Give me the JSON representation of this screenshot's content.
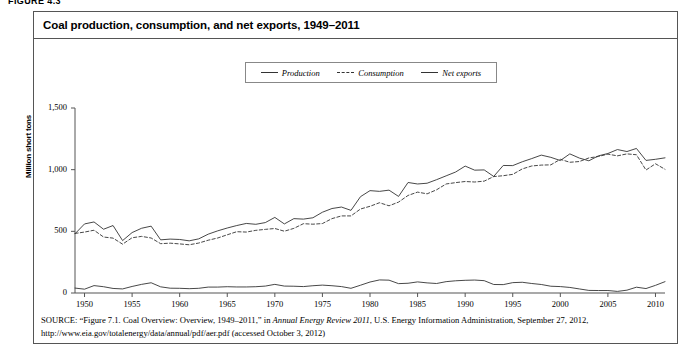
{
  "figure_label": "FIGURE 4.3",
  "title": "Coal production, consumption, and net exports, 1949–2011",
  "legend": {
    "items": [
      {
        "label": "Production",
        "style": "solid"
      },
      {
        "label": "Consumption",
        "style": "dashed"
      },
      {
        "label": "Net exports",
        "style": "solid"
      }
    ]
  },
  "source": {
    "label": "SOURCE:",
    "part1": " “Figure 7.1. Coal Overview: Overview, 1949–2011,” in ",
    "italic1": "Annual Energy Review 2011",
    "part2": ", U.S. Energy Information Administration, September 27, 2012, http://www.eia.gov/totalenergy/data/annual/pdf/aer.pdf (accessed October 3, 2012)"
  },
  "chart_data": {
    "type": "line",
    "title": "Coal production, consumption, and net exports, 1949–2011",
    "xlabel": "",
    "ylabel": "Million short tons",
    "ylim": [
      0,
      1500
    ],
    "xlim": [
      1949,
      2011
    ],
    "yticks": [
      "0",
      "500",
      "1,000",
      "1,500"
    ],
    "ytick_values": [
      0,
      500,
      1000,
      1500
    ],
    "xticks": [
      "1950",
      "1955",
      "1960",
      "1965",
      "1970",
      "1975",
      "1980",
      "1985",
      "1990",
      "1995",
      "2000",
      "2005",
      "2010"
    ],
    "xtick_values": [
      1950,
      1955,
      1960,
      1965,
      1970,
      1975,
      1980,
      1985,
      1990,
      1995,
      2000,
      2005,
      2010
    ],
    "grid": false,
    "legend_position": "top-center",
    "x": [
      1949,
      1950,
      1951,
      1952,
      1953,
      1954,
      1955,
      1956,
      1957,
      1958,
      1959,
      1960,
      1961,
      1962,
      1963,
      1964,
      1965,
      1966,
      1967,
      1968,
      1969,
      1970,
      1971,
      1972,
      1973,
      1974,
      1975,
      1976,
      1977,
      1978,
      1979,
      1980,
      1981,
      1982,
      1983,
      1984,
      1985,
      1986,
      1987,
      1988,
      1989,
      1990,
      1991,
      1992,
      1993,
      1994,
      1995,
      1996,
      1997,
      1998,
      1999,
      2000,
      2001,
      2002,
      2003,
      2004,
      2005,
      2006,
      2007,
      2008,
      2009,
      2010,
      2011
    ],
    "series": [
      {
        "name": "Production",
        "style": "solid",
        "values": [
          480,
          560,
          576,
          517,
          547,
          425,
          490,
          525,
          542,
          431,
          437,
          434,
          423,
          439,
          477,
          504,
          527,
          547,
          564,
          557,
          571,
          613,
          560,
          603,
          599,
          610,
          655,
          685,
          697,
          670,
          781,
          830,
          824,
          834,
          783,
          896,
          884,
          890,
          919,
          950,
          981,
          1029,
          996,
          998,
          945,
          1034,
          1033,
          1064,
          1090,
          1118,
          1100,
          1074,
          1128,
          1094,
          1072,
          1112,
          1131,
          1163,
          1147,
          1172,
          1075,
          1084,
          1096
        ],
        "units": "million short tons"
      },
      {
        "name": "Consumption",
        "style": "dashed",
        "values": [
          483,
          494,
          509,
          454,
          445,
          396,
          448,
          459,
          446,
          400,
          404,
          398,
          391,
          405,
          428,
          446,
          472,
          497,
          494,
          508,
          516,
          523,
          501,
          524,
          562,
          558,
          563,
          603,
          625,
          625,
          681,
          703,
          732,
          707,
          737,
          791,
          818,
          804,
          837,
          884,
          895,
          904,
          900,
          907,
          944,
          951,
          962,
          1006,
          1030,
          1037,
          1039,
          1084,
          1060,
          1066,
          1095,
          1107,
          1126,
          1112,
          1128,
          1121,
          997,
          1048,
          1003
        ],
        "units": "million short tons"
      },
      {
        "name": "Net exports",
        "style": "solid",
        "values": [
          40,
          31,
          60,
          51,
          37,
          33,
          53,
          70,
          83,
          50,
          39,
          38,
          35,
          38,
          48,
          48,
          51,
          49,
          49,
          51,
          56,
          70,
          56,
          55,
          52,
          59,
          64,
          59,
          52,
          38,
          63,
          89,
          106,
          104,
          76,
          79,
          90,
          82,
          77,
          92,
          99,
          103,
          105,
          100,
          69,
          68,
          84,
          87,
          77,
          69,
          55,
          52,
          45,
          33,
          21,
          20,
          20,
          13,
          23,
          47,
          36,
          62,
          92
        ],
        "units": "million short tons"
      }
    ]
  },
  "axes_geometry": {
    "plot_left": 75,
    "plot_right": 665,
    "plot_top": 108,
    "plot_bottom": 293
  }
}
